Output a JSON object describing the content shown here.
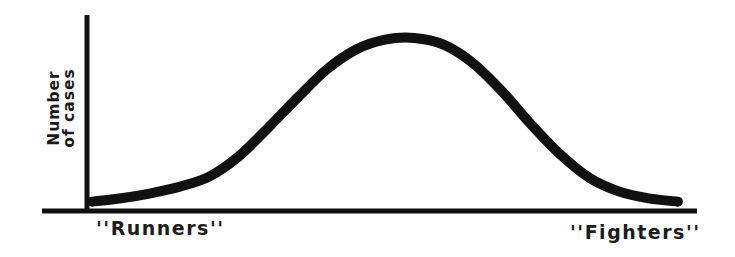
{
  "chart_data": {
    "type": "line",
    "title": "",
    "xlabel": "",
    "ylabel": "Number of cases",
    "ylabel_lines": [
      "Number",
      "of cases"
    ],
    "x_tick_labels": [
      "“Runners”",
      "“Fighters”"
    ],
    "x_tick_labels_text": [
      "''Runners''",
      "''Fighters''"
    ],
    "x": [
      0,
      5,
      10,
      15,
      20,
      25,
      30,
      35,
      40,
      45,
      50,
      55,
      60,
      65,
      70,
      75,
      80,
      85,
      90,
      95,
      100
    ],
    "series": [
      {
        "name": "distribution",
        "values": [
          2,
          4,
          7,
          11,
          17,
          29,
          46,
          64,
          81,
          93,
          99,
          100,
          96,
          85,
          68,
          48,
          30,
          16,
          8,
          4,
          2
        ]
      }
    ],
    "ylim": [
      0,
      105
    ],
    "xlim": [
      0,
      100
    ],
    "grid": false,
    "legend": "none",
    "shape": "bell curve, peak slightly right of center (~55% of x range)",
    "line_color": "#111111"
  },
  "labels": {
    "y_axis": [
      "Number",
      "of cases"
    ],
    "left_end": "“Runners”",
    "right_end": "“Fighters”"
  }
}
